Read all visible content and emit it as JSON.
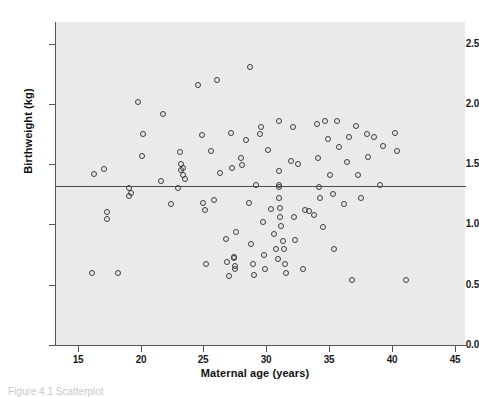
{
  "figure": {
    "background_color": "#ffffff",
    "panel_color": "#eaeaea",
    "axis_color": "#555555",
    "marker_color": "#3d3d3d",
    "caption": "Figure 4.1  Scatterplot"
  },
  "chart_data": {
    "type": "scatter",
    "title": "",
    "xlabel": "Maternal age (years)",
    "ylabel": "Birthweight (kg)",
    "xlim": [
      13.2,
      45.8
    ],
    "ylim": [
      0.0,
      2.68
    ],
    "xticks": [
      15,
      20,
      25,
      30,
      35,
      40,
      45
    ],
    "xtick_labels": [
      "15",
      "20",
      "25",
      "30",
      "35",
      "40",
      "45"
    ],
    "yticks": [
      0.0,
      0.5,
      1.0,
      1.5,
      2.0,
      2.5
    ],
    "ytick_labels": [
      "0.0",
      "0.5",
      "1.0",
      "1.5",
      "2.0",
      "2.5"
    ],
    "grid": false,
    "legend": null,
    "reference_line": {
      "orientation": "horizontal",
      "y": 1.32,
      "label": "mean birthweight"
    },
    "series": [
      {
        "name": "Births",
        "marker": "open-circle",
        "points": [
          [
            16.1,
            0.6
          ],
          [
            16.3,
            1.42
          ],
          [
            17.1,
            1.46
          ],
          [
            17.3,
            1.1
          ],
          [
            17.3,
            1.05
          ],
          [
            18.2,
            0.6
          ],
          [
            19.1,
            1.3
          ],
          [
            19.1,
            1.24
          ],
          [
            19.2,
            1.26
          ],
          [
            19.8,
            2.02
          ],
          [
            20.1,
            1.57
          ],
          [
            20.2,
            1.75
          ],
          [
            21.6,
            1.36
          ],
          [
            21.8,
            1.92
          ],
          [
            22.4,
            1.17
          ],
          [
            23.0,
            1.3
          ],
          [
            23.1,
            1.6
          ],
          [
            23.2,
            1.45
          ],
          [
            23.2,
            1.5
          ],
          [
            23.4,
            1.47
          ],
          [
            23.4,
            1.41
          ],
          [
            23.5,
            1.38
          ],
          [
            24.6,
            2.16
          ],
          [
            24.9,
            1.74
          ],
          [
            25.0,
            1.18
          ],
          [
            25.1,
            1.12
          ],
          [
            25.2,
            0.67
          ],
          [
            25.6,
            1.61
          ],
          [
            25.8,
            1.2
          ],
          [
            26.1,
            2.2
          ],
          [
            26.3,
            1.43
          ],
          [
            26.8,
            0.88
          ],
          [
            26.9,
            0.69
          ],
          [
            27.0,
            0.57
          ],
          [
            27.2,
            1.76
          ],
          [
            27.3,
            1.47
          ],
          [
            27.4,
            0.73
          ],
          [
            27.4,
            0.72
          ],
          [
            27.5,
            0.63
          ],
          [
            27.5,
            0.66
          ],
          [
            27.6,
            0.94
          ],
          [
            28.0,
            1.55
          ],
          [
            28.1,
            1.49
          ],
          [
            28.4,
            1.7
          ],
          [
            28.6,
            1.18
          ],
          [
            28.7,
            2.31
          ],
          [
            28.8,
            0.84
          ],
          [
            28.9,
            0.67
          ],
          [
            29.0,
            0.58
          ],
          [
            29.2,
            1.33
          ],
          [
            29.5,
            1.75
          ],
          [
            29.6,
            1.81
          ],
          [
            29.7,
            1.02
          ],
          [
            29.8,
            0.75
          ],
          [
            29.9,
            0.63
          ],
          [
            30.1,
            1.62
          ],
          [
            30.4,
            1.13
          ],
          [
            30.6,
            0.92
          ],
          [
            30.8,
            0.8
          ],
          [
            30.9,
            0.71
          ],
          [
            31.0,
            1.86
          ],
          [
            31.0,
            1.44
          ],
          [
            31.0,
            1.33
          ],
          [
            31.0,
            1.31
          ],
          [
            31.0,
            1.22
          ],
          [
            31.1,
            1.14
          ],
          [
            31.1,
            1.06
          ],
          [
            31.2,
            0.99
          ],
          [
            31.3,
            0.86
          ],
          [
            31.4,
            0.8
          ],
          [
            31.5,
            0.67
          ],
          [
            31.6,
            0.6
          ],
          [
            32.0,
            1.53
          ],
          [
            32.1,
            1.81
          ],
          [
            32.2,
            1.06
          ],
          [
            32.3,
            0.87
          ],
          [
            32.5,
            1.5
          ],
          [
            32.9,
            0.63
          ],
          [
            33.1,
            1.12
          ],
          [
            33.4,
            1.11
          ],
          [
            33.8,
            1.08
          ],
          [
            34.0,
            1.83
          ],
          [
            34.1,
            1.55
          ],
          [
            34.2,
            1.31
          ],
          [
            34.3,
            1.22
          ],
          [
            34.5,
            0.98
          ],
          [
            34.7,
            1.86
          ],
          [
            34.9,
            1.71
          ],
          [
            35.1,
            1.41
          ],
          [
            35.3,
            1.25
          ],
          [
            35.4,
            0.8
          ],
          [
            35.6,
            1.86
          ],
          [
            35.8,
            1.64
          ],
          [
            36.2,
            1.17
          ],
          [
            36.4,
            1.52
          ],
          [
            36.6,
            1.73
          ],
          [
            36.8,
            0.54
          ],
          [
            37.1,
            1.82
          ],
          [
            37.3,
            1.41
          ],
          [
            37.5,
            1.22
          ],
          [
            38.0,
            1.75
          ],
          [
            38.1,
            1.56
          ],
          [
            38.6,
            1.73
          ],
          [
            39.0,
            1.33
          ],
          [
            39.3,
            1.65
          ],
          [
            40.2,
            1.76
          ],
          [
            40.4,
            1.61
          ],
          [
            41.1,
            0.54
          ]
        ]
      }
    ]
  }
}
